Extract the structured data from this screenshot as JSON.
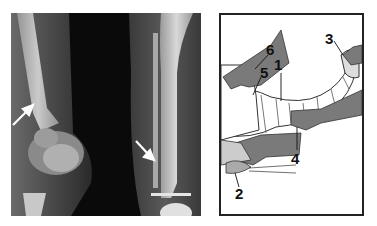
{
  "figure": {
    "left_panel": {
      "type": "radiograph",
      "description": "X-ray of child's knee and lower leg with two white arrows indicating findings",
      "arrows": [
        {
          "id": "arrow-left",
          "direction": "up-right"
        },
        {
          "id": "arrow-right",
          "direction": "down-right"
        }
      ]
    },
    "right_panel": {
      "type": "line-drawing",
      "description": "Illustration of cast application on a leg with hands holding limb",
      "labels": [
        {
          "id": "1",
          "text": "1"
        },
        {
          "id": "2",
          "text": "2"
        },
        {
          "id": "3",
          "text": "3"
        },
        {
          "id": "4",
          "text": "4"
        },
        {
          "id": "5",
          "text": "5"
        },
        {
          "id": "6",
          "text": "6"
        }
      ]
    },
    "colors": {
      "xray_bg": "#0a0a0a",
      "bone": "#cfcfcf",
      "hand_fill": "#7a7a7a",
      "cast_fill": "#ffffff",
      "frame": "#222222"
    }
  }
}
